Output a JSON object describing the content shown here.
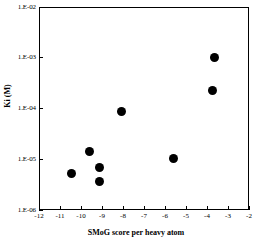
{
  "chart_data": {
    "type": "scatter",
    "title": "",
    "xlabel": "SMoG score per heavy atom",
    "ylabel": "Ki (M)",
    "yscale": "log",
    "xlim": [
      -12,
      -2
    ],
    "ylim": [
      1e-06,
      0.01
    ],
    "grid": false,
    "legend": null,
    "x_ticks": [
      -12,
      -11,
      -10,
      -9,
      -8,
      -7,
      -6,
      -5,
      -4,
      -3,
      -2
    ],
    "x_tick_labels": [
      "-12",
      "-11",
      "-10",
      "-9",
      "-8",
      "-7",
      "-6",
      "-5",
      "-4",
      "-3",
      "-2"
    ],
    "y_ticks": [
      0.01,
      0.001,
      0.0001,
      1e-05,
      1e-06
    ],
    "y_tick_labels": [
      "1.E-02",
      "1.E-03",
      "1.E-04",
      "1.E-05",
      "1.E-06"
    ],
    "marker": "filled-circle",
    "marker_color": "#000000",
    "points": [
      {
        "x": -10.45,
        "y": 5.3e-06
      },
      {
        "x": -9.6,
        "y": 1.4e-05
      },
      {
        "x": -9.1,
        "y": 6.8e-06
      },
      {
        "x": -9.1,
        "y": 3.6e-06
      },
      {
        "x": -8.05,
        "y": 8.7e-05
      },
      {
        "x": -5.6,
        "y": 1.05e-05
      },
      {
        "x": -3.75,
        "y": 0.00023
      },
      {
        "x": -3.65,
        "y": 0.001
      }
    ]
  },
  "axes": {
    "frame_color": "#000000",
    "background": "#ffffff"
  }
}
